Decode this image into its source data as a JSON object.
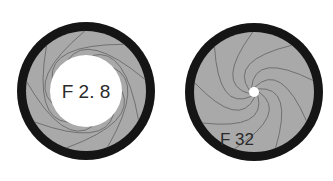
{
  "diagram": {
    "apertures": [
      {
        "id": "wide",
        "label": "F 2. 8",
        "center": [
          86,
          91
        ],
        "outer_radius": 69,
        "ring_width": 9,
        "opening_radius": 36,
        "blade_count": 9
      },
      {
        "id": "narrow",
        "label": "F 32",
        "center": [
          254,
          92
        ],
        "outer_radius": 69,
        "ring_width": 9,
        "opening_radius": 5,
        "blade_count": 9
      }
    ],
    "colors": {
      "ring": "#151515",
      "blades": "#a9a9a9",
      "blade_lines": "#6a6a6a",
      "opening": "#ffffff",
      "text": "#2a2a2a"
    }
  }
}
